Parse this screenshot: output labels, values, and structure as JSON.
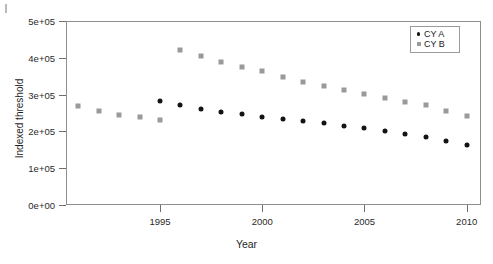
{
  "chart_data": {
    "type": "scatter",
    "title": "",
    "xlabel": "Year",
    "ylabel": "Indexed threshold",
    "xlim": [
      1990.4,
      2010.7
    ],
    "ylim": [
      0,
      500000
    ],
    "grid": false,
    "legend_position": "top-right",
    "xticks": [
      "1995",
      "2000",
      "2005",
      "2010"
    ],
    "xtick_values": [
      1995,
      2000,
      2005,
      2010
    ],
    "yticks": [
      "0e+00",
      "1e+05",
      "2e+05",
      "3e+05",
      "4e+05",
      "5e+05"
    ],
    "ytick_values": [
      0,
      100000,
      200000,
      300000,
      400000,
      500000
    ],
    "series": [
      {
        "name": "CY A",
        "marker": "circle",
        "color": "#131313",
        "x": [
          1995,
          1996,
          1997,
          1998,
          1999,
          2000,
          2001,
          2002,
          2003,
          2004,
          2005,
          2006,
          2007,
          2008,
          2009,
          2010
        ],
        "values": [
          283000,
          272000,
          262000,
          252000,
          246000,
          240000,
          234000,
          228000,
          222000,
          216000,
          210000,
          200000,
          192000,
          185000,
          174000,
          164000
        ]
      },
      {
        "name": "CY B",
        "marker": "square",
        "color": "#9a9a9a",
        "x": [
          1991,
          1992,
          1993,
          1994,
          1995,
          1996,
          1997,
          1998,
          1999,
          2000,
          2001,
          2002,
          2003,
          2004,
          2005,
          2006,
          2007,
          2008,
          2009,
          2010
        ],
        "values": [
          269000,
          255000,
          245000,
          238000,
          231000,
          420000,
          404000,
          389000,
          376000,
          364000,
          348000,
          334000,
          324000,
          313000,
          301000,
          290000,
          281000,
          272000,
          256000,
          243000
        ]
      }
    ]
  },
  "legend": {
    "items": [
      {
        "label": "CY A",
        "marker": "circle-marker"
      },
      {
        "label": "CY B",
        "marker": "square-marker"
      }
    ]
  }
}
